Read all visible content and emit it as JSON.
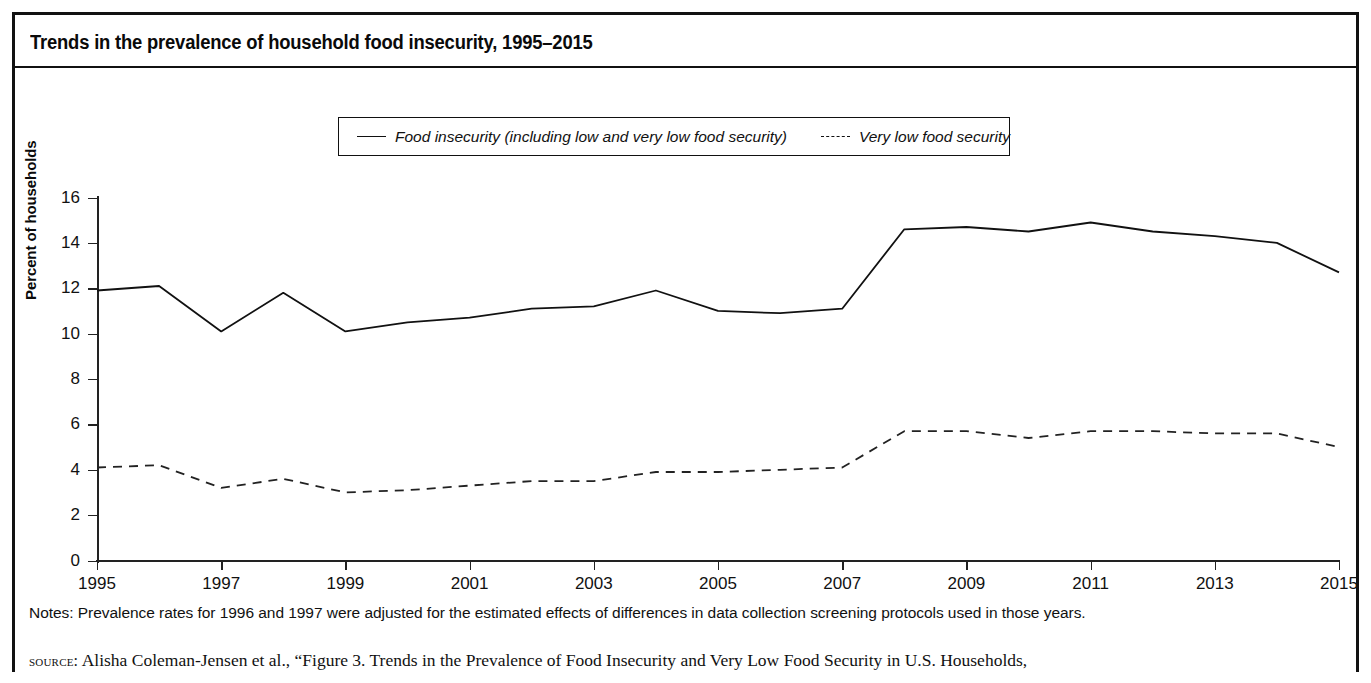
{
  "figure": {
    "title": "Trends in the prevalence of household food insecurity, 1995–2015",
    "notes": "Notes: Prevalence rates for 1996 and 1997 were adjusted for the estimated effects of differences in data collection screening protocols used in those years.",
    "source_prefix": "source:",
    "source_text": "Alisha Coleman-Jensen et al., “Figure 3. Trends in the Prevalence of Food Insecurity and Very Low Food Security in U.S. Households,",
    "line_color": "#111111",
    "background_color": "#ffffff"
  },
  "chart_data": {
    "type": "line",
    "title": "Trends in the prevalence of household food insecurity, 1995–2015",
    "xlabel": "",
    "ylabel": "Percent of households",
    "xlim": [
      1995,
      2015
    ],
    "ylim": [
      0,
      16
    ],
    "grid": false,
    "legend_position": "top-center",
    "x": [
      1995,
      1996,
      1997,
      1998,
      1999,
      2000,
      2001,
      2002,
      2003,
      2004,
      2005,
      2006,
      2007,
      2008,
      2009,
      2010,
      2011,
      2012,
      2013,
      2014,
      2015
    ],
    "x_tick_labels": [
      "1995",
      "1997",
      "1999",
      "2001",
      "2003",
      "2005",
      "2007",
      "2009",
      "2011",
      "2013",
      "2015"
    ],
    "y_tick_labels": [
      "0",
      "2",
      "4",
      "6",
      "8",
      "10",
      "12",
      "14",
      "16"
    ],
    "y_ticks": [
      0,
      2,
      4,
      6,
      8,
      10,
      12,
      14,
      16
    ],
    "series": [
      {
        "name": "Food insecurity (including low and very low food security)",
        "style": "solid",
        "values": [
          11.9,
          12.1,
          10.1,
          11.8,
          10.1,
          10.5,
          10.7,
          11.1,
          11.2,
          11.9,
          11.0,
          10.9,
          11.1,
          14.6,
          14.7,
          14.5,
          14.9,
          14.5,
          14.3,
          14.0,
          12.7
        ]
      },
      {
        "name": "Very low food security",
        "style": "dashed",
        "values": [
          4.1,
          4.2,
          3.2,
          3.6,
          3.0,
          3.1,
          3.3,
          3.5,
          3.5,
          3.9,
          3.9,
          4.0,
          4.1,
          5.7,
          5.7,
          5.4,
          5.7,
          5.7,
          5.6,
          5.6,
          5.0
        ]
      }
    ]
  },
  "legend": {
    "items": [
      {
        "label": "Food insecurity (including low and very low food security)",
        "style": "solid"
      },
      {
        "label": "Very low food security",
        "style": "dashed"
      }
    ]
  }
}
